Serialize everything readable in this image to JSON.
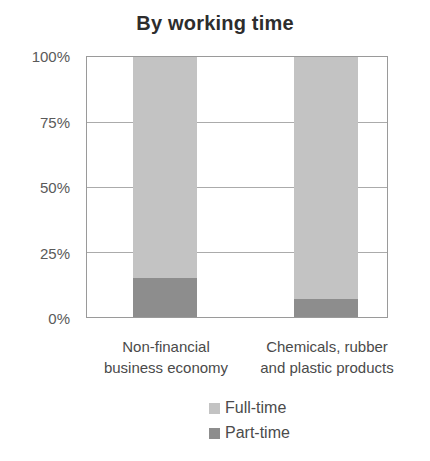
{
  "chart_data": {
    "type": "bar",
    "stacked": true,
    "orientation": "vertical",
    "title": "By working time",
    "categories": [
      [
        "Non-financial",
        "business economy"
      ],
      [
        "Chemicals, rubber",
        "and plastic products"
      ]
    ],
    "series": [
      {
        "name": "Full-time",
        "values": [
          85,
          93
        ],
        "color": "#c3c3c3"
      },
      {
        "name": "Part-time",
        "values": [
          15,
          7
        ],
        "color": "#8d8d8d"
      }
    ],
    "stack_order": "top-to-bottom",
    "ylabel": "",
    "xlabel": "",
    "ylim": [
      0,
      100
    ],
    "yticks": [
      "100%",
      "75%",
      "50%",
      "25%",
      "0%"
    ],
    "grid": true,
    "gridline_color": "#ababab",
    "plot_border_color": "#9a9a9a",
    "legend_position": "bottom"
  },
  "legend": {
    "items": [
      {
        "label": "Full-time",
        "color": "#c3c3c3"
      },
      {
        "label": "Part-time",
        "color": "#8d8d8d"
      }
    ]
  }
}
